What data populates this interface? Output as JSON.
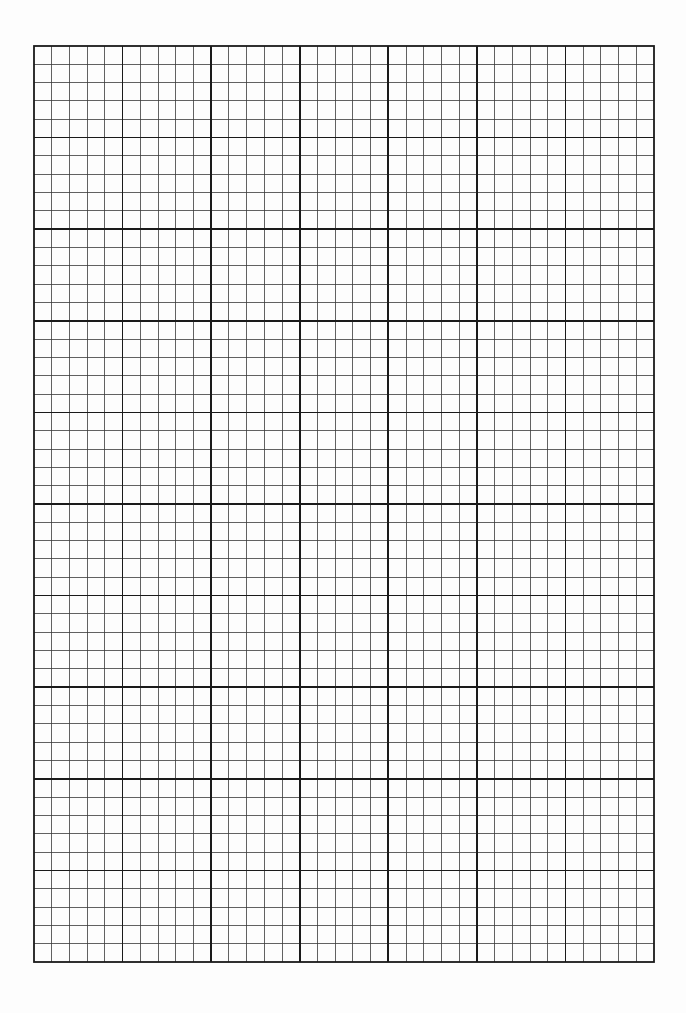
{
  "page": {
    "type": "blank-graph-paper",
    "background_color": "#ffffff"
  },
  "grid": {
    "x": 33,
    "y": 45,
    "width": 620,
    "height": 916,
    "major_columns": 7,
    "major_rows": 10,
    "minor_per_major": 5,
    "line_color": "#1a1a1a",
    "minor_line_color": "#3a3a3a",
    "major_stroke_width": 1.6,
    "minor_stroke_width": 0.8,
    "border_stroke_width": 1.8
  }
}
